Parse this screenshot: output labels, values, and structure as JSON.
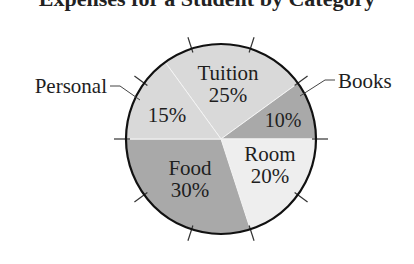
{
  "chart_data": {
    "type": "pie",
    "title": "Expenses for a Student by Category",
    "title_visible": "partially cropped (only descenders visible)",
    "categories": [
      "Tuition",
      "Books",
      "Room",
      "Food",
      "Personal"
    ],
    "values": [
      25,
      10,
      20,
      30,
      15
    ],
    "value_labels": [
      "25%",
      "10%",
      "20%",
      "30%",
      "15%"
    ],
    "colors": [
      "#d9d9d9",
      "#a9a9a9",
      "#eeeeee",
      "#a9a9a9",
      "#d9d9d9"
    ],
    "label_placement": {
      "Tuition": "inside",
      "Books": "outside-right with leader line",
      "Room": "inside",
      "Food": "inside",
      "Personal": "outside-left with leader line"
    },
    "tick_marks": "10 ticks every 36 degrees around circumference",
    "legend": "none"
  },
  "labels": {
    "tuition_name": "Tuition",
    "tuition_pct": "25%",
    "books_name": "Books",
    "books_pct": "10%",
    "room_name": "Room",
    "room_pct": "20%",
    "food_name": "Food",
    "food_pct": "30%",
    "personal_name": "Personal",
    "personal_pct": "15%"
  }
}
